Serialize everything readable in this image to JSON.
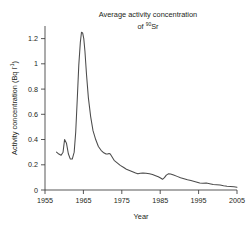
{
  "chart_data": {
    "type": "line",
    "title": "Average activity concentration",
    "title_line2_prefix": "of ",
    "title_line2_sup": "90",
    "title_line2_suffix": "Sr",
    "title_full": "Average activity concentration of 90Sr",
    "xlabel": "Year",
    "ylabel_prefix": "Activity concentration (Bq l",
    "ylabel_sup": "-1",
    "ylabel_suffix": ")",
    "ylabel_full": "Activity concentration (Bq l-1)",
    "xlim": [
      1955,
      2005
    ],
    "ylim": [
      0,
      1.3
    ],
    "xticks": [
      1955,
      1965,
      1975,
      1985,
      1995,
      2005
    ],
    "xtick_labels": [
      "1955",
      "1965",
      "1975",
      "1985",
      "1995",
      "2005"
    ],
    "yticks": [
      0,
      0.2,
      0.4,
      0.6,
      0.8,
      1,
      1.2
    ],
    "ytick_labels": [
      "0",
      "0.2",
      "0.4",
      "0.6",
      "0.8",
      "1",
      "1.2"
    ],
    "grid": false,
    "legend": false,
    "line_color": "#4b4b4b",
    "axis_color": "#3a3a3a",
    "background": "#ffffff",
    "series": [
      {
        "name": "Average activity concentration of 90Sr",
        "x": [
          1958.0,
          1958.6,
          1959.2,
          1959.7,
          1960.1,
          1960.6,
          1961.1,
          1961.6,
          1962.1,
          1962.6,
          1963.0,
          1963.4,
          1963.8,
          1964.2,
          1964.5,
          1964.8,
          1965.1,
          1965.4,
          1965.8,
          1966.3,
          1966.9,
          1967.5,
          1968.2,
          1968.9,
          1969.6,
          1970.3,
          1970.9,
          1971.3,
          1971.7,
          1972.0,
          1972.4,
          1973.0,
          1973.8,
          1974.6,
          1975.4,
          1976.2,
          1977.0,
          1977.8,
          1978.6,
          1979.2,
          1979.8,
          1980.5,
          1981.3,
          1982.2,
          1983.0,
          1983.8,
          1984.5,
          1985.1,
          1985.6,
          1986.1,
          1986.6,
          1987.1,
          1987.7,
          1988.5,
          1989.4,
          1990.3,
          1991.2,
          1992.1,
          1993.0,
          1993.9,
          1994.6,
          1995.3,
          1996.1,
          1997.0,
          1997.9,
          1998.8,
          1999.7,
          2000.6,
          2001.5,
          2002.4,
          2003.3,
          2004.2,
          2005.0
        ],
        "y": [
          0.3,
          0.285,
          0.275,
          0.3,
          0.4,
          0.37,
          0.285,
          0.245,
          0.245,
          0.3,
          0.46,
          0.72,
          0.99,
          1.17,
          1.25,
          1.245,
          1.2,
          1.1,
          0.92,
          0.73,
          0.58,
          0.47,
          0.4,
          0.345,
          0.315,
          0.295,
          0.285,
          0.285,
          0.29,
          0.285,
          0.265,
          0.235,
          0.215,
          0.195,
          0.18,
          0.165,
          0.155,
          0.145,
          0.135,
          0.128,
          0.132,
          0.135,
          0.132,
          0.128,
          0.122,
          0.113,
          0.105,
          0.095,
          0.085,
          0.098,
          0.118,
          0.128,
          0.126,
          0.118,
          0.108,
          0.098,
          0.09,
          0.082,
          0.075,
          0.068,
          0.062,
          0.055,
          0.053,
          0.055,
          0.05,
          0.044,
          0.042,
          0.04,
          0.034,
          0.03,
          0.028,
          0.025,
          0.022
        ]
      }
    ]
  }
}
